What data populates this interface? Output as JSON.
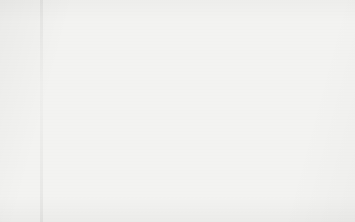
{
  "figure": {
    "background_color": "#f3f3f1",
    "outline_color": "#3a3a3a",
    "text_color": "#1c1c1c"
  },
  "chart_data": {
    "type": "pie",
    "title": "",
    "subtitle": "",
    "xlabel": "",
    "ylabel": "",
    "legend_position": "none",
    "grid": false,
    "units": "percent",
    "start_angle_deg": 0,
    "direction": "clockwise",
    "total": 100,
    "categories": [
      "Germany",
      "UK",
      "USA",
      "Italy",
      "Switzerland",
      "Spain",
      "France",
      "The Netherland",
      "Austria",
      "Canada",
      "Others"
    ],
    "values": [
      45,
      12,
      10,
      4,
      3,
      3,
      2,
      2,
      2,
      2,
      15
    ],
    "slices": [
      {
        "name": "Germany",
        "value": 45,
        "label_name": "Germany",
        "label_pct": "45%",
        "color": "#9a9a9a",
        "label_placement": "inside",
        "label_x": 286,
        "label_y": 86
      },
      {
        "name": "UK",
        "value": 12,
        "label_name": "UK",
        "label_pct": "12%",
        "color": "#c0c0c0",
        "label_placement": "inside",
        "label_x": 265,
        "label_y": 167
      },
      {
        "name": "USA",
        "value": 10,
        "label_name": "USA",
        "label_pct": "10%",
        "color": "#f2f2f0",
        "label_placement": "inside",
        "label_x": 204,
        "label_y": 152
      },
      {
        "name": "Italy",
        "value": 4,
        "label_name": "Italy 4%",
        "label_pct": "4%",
        "color": "#1f1f1f",
        "label_placement": "callout",
        "label_x": 69,
        "label_y": 186,
        "leader": {
          "x1": 101,
          "y1": 186,
          "x2": 176,
          "y2": 138
        }
      },
      {
        "name": "Switzerland",
        "value": 3,
        "label_name": "Switzerland 3%",
        "label_pct": "3%",
        "color": "#6e6e6e",
        "label_placement": "callout",
        "label_x": 33,
        "label_y": 155,
        "leader": {
          "x1": 114,
          "y1": 154,
          "x2": 158,
          "y2": 123
        }
      },
      {
        "name": "Spain",
        "value": 3,
        "label_name": "Spain 3%",
        "label_pct": "3%",
        "color": "#a5a5a5",
        "label_placement": "callout",
        "label_x": 61,
        "label_y": 126,
        "leader": {
          "x1": 116,
          "y1": 125,
          "x2": 147,
          "y2": 110
        }
      },
      {
        "name": "France",
        "value": 2,
        "label_name": "France 2%",
        "label_pct": "2%",
        "color": "#cccccc",
        "label_placement": "callout",
        "label_x": 55,
        "label_y": 95,
        "leader": {
          "x1": 113,
          "y1": 95,
          "x2": 146,
          "y2": 96
        }
      },
      {
        "name": "The Netherland",
        "value": 2,
        "label_name": "The Netherland 2%",
        "label_pct": "2%",
        "color": "#fbfbfa",
        "label_placement": "callout",
        "label_x": 12,
        "label_y": 66,
        "leader": {
          "x1": 112,
          "y1": 66,
          "x2": 152,
          "y2": 83
        }
      },
      {
        "name": "Austria",
        "value": 2,
        "label_name": "Austria 2%",
        "label_pct": "2%",
        "color": "#7d7d7d",
        "label_placement": "callout",
        "label_x": 56,
        "label_y": 40,
        "leader": {
          "x1": 110,
          "y1": 40,
          "x2": 162,
          "y2": 70
        }
      },
      {
        "name": "Canada",
        "value": 2,
        "label_name": "Canada 2%",
        "label_pct": "2%",
        "color": "#b2b2b2",
        "label_placement": "callout",
        "label_x": 52,
        "label_y": 13,
        "leader": {
          "x1": 111,
          "y1": 14,
          "x2": 172,
          "y2": 59
        }
      },
      {
        "name": "Others",
        "value": 15,
        "label_name": "Others",
        "label_pct": "15%",
        "color": "#fbfbfa",
        "label_placement": "inside",
        "label_x": 212,
        "label_y": 47
      }
    ]
  }
}
